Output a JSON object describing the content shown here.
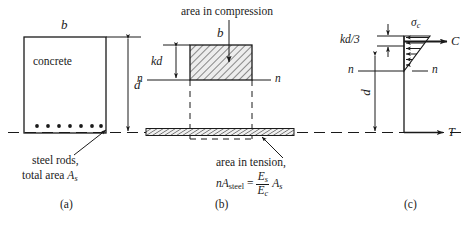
{
  "figure": {
    "panels": [
      {
        "key": "a",
        "caption": "(a)",
        "x": 166,
        "y": 199
      },
      {
        "key": "b",
        "caption": "(b)",
        "x": 220,
        "y": 199
      },
      {
        "key": "c",
        "caption": "(c)",
        "x": 410,
        "y": 199
      }
    ]
  },
  "panel_a": {
    "width_label": "b",
    "material_label": "concrete",
    "depth_label": "d",
    "callout_line1": "steel rods,",
    "callout_line2_prefix": "total area ",
    "callout_line2_sym": "A",
    "callout_line2_sub": "s",
    "rod_count": 7
  },
  "panel_b": {
    "compression_label": "area in compression",
    "width_label": "b",
    "kd_label": "kd",
    "axis_label_left": "n",
    "axis_label_right": "n",
    "tension_label": "area in tension,",
    "formula": {
      "n_sym": "n",
      "A_sym": "A",
      "A_sub": "steel",
      "equals": "=",
      "num_sym": "E",
      "num_sub": "s",
      "den_sym": "E",
      "den_sub": "c",
      "tail_sym": "A",
      "tail_sub": "s"
    }
  },
  "panel_c": {
    "kd3_label": "kd/3",
    "sigma_label": "σ",
    "sigma_sub": "c",
    "compression_force": "C",
    "tension_force": "T",
    "axis_label_left": "n",
    "axis_label_right": "n",
    "depth_label": "d",
    "stress_arrow_count": 6
  },
  "colors": {
    "ink": "#1a1a1a",
    "hatch": "#2a2a2a",
    "hatch_fill": "#e8e8e8",
    "background": "#ffffff"
  }
}
